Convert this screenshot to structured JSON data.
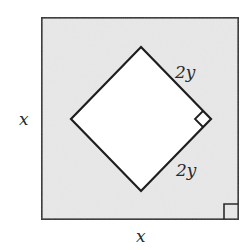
{
  "diagram": {
    "outer_square": {
      "description": "Outer square with shaded region",
      "side_label_left": "x",
      "side_label_bottom": "x",
      "fill": "#e9e9e9",
      "stroke": "#2b2b2b"
    },
    "inner_square": {
      "description": "Inner square rotated 45 degrees (diamond), unshaded",
      "upper_right_side_label": "2y",
      "lower_right_side_label": "2y",
      "fill": "#ffffff",
      "stroke": "#1e1e1e"
    },
    "right_angle_markers": [
      {
        "location": "inner square right vertex"
      },
      {
        "location": "outer square bottom-right corner"
      }
    ]
  }
}
